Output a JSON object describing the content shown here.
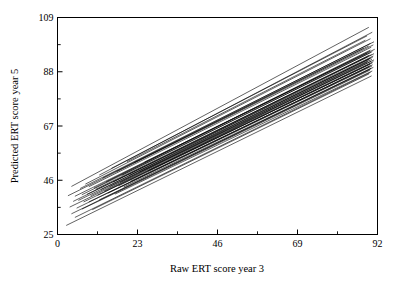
{
  "chart_data": {
    "type": "line",
    "title": "",
    "subtitle": "",
    "xlabel": "Raw ERT score year 3",
    "ylabel": "Predicted ERT score year 5",
    "xlim": [
      0,
      92
    ],
    "ylim": [
      25,
      109
    ],
    "xticks": [
      0,
      23,
      46,
      69,
      92
    ],
    "xticklabels": [
      "0",
      "23",
      "46",
      "69",
      "92"
    ],
    "xminorticks": [
      11.5,
      34.5,
      57.5,
      80.5
    ],
    "yticks": [
      25,
      46,
      67,
      88,
      109
    ],
    "yticklabels": [
      "25",
      "46",
      "67",
      "88",
      "109"
    ],
    "yminorticks": [
      35.5,
      56.5,
      77.5,
      98.5
    ],
    "grid": false,
    "legend": false,
    "legend_position": "none",
    "frame": "box",
    "tick_direction": "in",
    "line_color": "#000000",
    "background_color": "#ffffff",
    "n_series": 46,
    "series": [
      {
        "name": "school-01",
        "x": [
          4.0,
          89.5
        ],
        "y": [
          43.6,
          105.2
        ]
      },
      {
        "name": "school-02",
        "x": [
          12.0,
          90.5
        ],
        "y": [
          48.0,
          103.3
        ]
      },
      {
        "name": "school-03",
        "x": [
          15.5,
          89.0
        ],
        "y": [
          50.6,
          101.9
        ]
      },
      {
        "name": "school-04",
        "x": [
          8.0,
          90.0
        ],
        "y": [
          44.5,
          100.8
        ]
      },
      {
        "name": "school-05",
        "x": [
          20.0,
          88.5
        ],
        "y": [
          53.2,
          100.2
        ]
      },
      {
        "name": "school-06",
        "x": [
          6.5,
          91.0
        ],
        "y": [
          42.8,
          99.6
        ]
      },
      {
        "name": "school-07",
        "x": [
          13.0,
          90.0
        ],
        "y": [
          46.9,
          99.0
        ]
      },
      {
        "name": "school-08",
        "x": [
          3.0,
          90.8
        ],
        "y": [
          40.0,
          98.4
        ]
      },
      {
        "name": "school-09",
        "x": [
          17.0,
          89.5
        ],
        "y": [
          49.4,
          98.0
        ]
      },
      {
        "name": "school-10",
        "x": [
          9.0,
          90.2
        ],
        "y": [
          43.5,
          97.5
        ]
      },
      {
        "name": "school-11",
        "x": [
          22.0,
          88.0
        ],
        "y": [
          52.8,
          97.1
        ]
      },
      {
        "name": "school-12",
        "x": [
          5.0,
          91.2
        ],
        "y": [
          39.8,
          96.7
        ]
      },
      {
        "name": "school-13",
        "x": [
          14.0,
          90.0
        ],
        "y": [
          45.4,
          96.4
        ]
      },
      {
        "name": "school-14",
        "x": [
          10.5,
          89.8
        ],
        "y": [
          43.0,
          96.0
        ]
      },
      {
        "name": "school-15",
        "x": [
          18.5,
          90.5
        ],
        "y": [
          47.9,
          95.8
        ]
      },
      {
        "name": "school-16",
        "x": [
          7.0,
          90.0
        ],
        "y": [
          40.4,
          95.4
        ]
      },
      {
        "name": "school-17",
        "x": [
          25.0,
          89.0
        ],
        "y": [
          53.0,
          95.2
        ]
      },
      {
        "name": "school-18",
        "x": [
          11.0,
          91.0
        ],
        "y": [
          42.5,
          95.0
        ]
      },
      {
        "name": "school-19",
        "x": [
          4.5,
          90.3
        ],
        "y": [
          37.8,
          94.6
        ]
      },
      {
        "name": "school-20",
        "x": [
          16.0,
          89.6
        ],
        "y": [
          45.3,
          94.4
        ]
      },
      {
        "name": "school-21",
        "x": [
          8.5,
          90.8
        ],
        "y": [
          40.6,
          94.1
        ]
      },
      {
        "name": "school-22",
        "x": [
          20.5,
          89.2
        ],
        "y": [
          47.8,
          93.8
        ]
      },
      {
        "name": "school-23",
        "x": [
          12.5,
          90.6
        ],
        "y": [
          42.4,
          93.6
        ]
      },
      {
        "name": "school-24",
        "x": [
          6.0,
          90.0
        ],
        "y": [
          38.2,
          93.3
        ]
      },
      {
        "name": "school-25",
        "x": [
          23.5,
          89.8
        ],
        "y": [
          49.2,
          93.1
        ]
      },
      {
        "name": "school-26",
        "x": [
          15.0,
          90.4
        ],
        "y": [
          43.6,
          92.8
        ]
      },
      {
        "name": "school-27",
        "x": [
          9.5,
          91.0
        ],
        "y": [
          40.0,
          92.6
        ]
      },
      {
        "name": "school-28",
        "x": [
          18.0,
          89.4
        ],
        "y": [
          45.2,
          92.4
        ]
      },
      {
        "name": "school-29",
        "x": [
          3.5,
          90.2
        ],
        "y": [
          35.6,
          92.1
        ]
      },
      {
        "name": "school-30",
        "x": [
          13.5,
          90.8
        ],
        "y": [
          41.8,
          91.9
        ]
      },
      {
        "name": "school-31",
        "x": [
          26.0,
          89.0
        ],
        "y": [
          49.6,
          91.7
        ]
      },
      {
        "name": "school-32",
        "x": [
          7.5,
          90.5
        ],
        "y": [
          37.6,
          91.4
        ]
      },
      {
        "name": "school-33",
        "x": [
          17.5,
          90.0
        ],
        "y": [
          43.8,
          91.2
        ]
      },
      {
        "name": "school-34",
        "x": [
          11.5,
          89.8
        ],
        "y": [
          40.2,
          90.9
        ]
      },
      {
        "name": "school-35",
        "x": [
          21.0,
          90.6
        ],
        "y": [
          45.6,
          90.7
        ]
      },
      {
        "name": "school-36",
        "x": [
          5.5,
          90.0
        ],
        "y": [
          35.2,
          90.4
        ]
      },
      {
        "name": "school-37",
        "x": [
          14.5,
          90.4
        ],
        "y": [
          41.0,
          90.2
        ]
      },
      {
        "name": "school-38",
        "x": [
          9.0,
          89.6
        ],
        "y": [
          37.6,
          89.9
        ]
      },
      {
        "name": "school-39",
        "x": [
          19.0,
          90.8
        ],
        "y": [
          43.4,
          89.7
        ]
      },
      {
        "name": "school-40",
        "x": [
          4.0,
          90.2
        ],
        "y": [
          33.0,
          89.4
        ]
      },
      {
        "name": "school-41",
        "x": [
          12.0,
          90.0
        ],
        "y": [
          38.4,
          89.0
        ]
      },
      {
        "name": "school-42",
        "x": [
          7.0,
          89.8
        ],
        "y": [
          34.8,
          88.6
        ]
      },
      {
        "name": "school-43",
        "x": [
          16.5,
          90.5
        ],
        "y": [
          40.6,
          88.3
        ]
      },
      {
        "name": "school-44",
        "x": [
          5.0,
          90.0
        ],
        "y": [
          31.6,
          87.8
        ]
      },
      {
        "name": "school-45",
        "x": [
          10.0,
          89.6
        ],
        "y": [
          34.6,
          87.2
        ]
      },
      {
        "name": "school-46",
        "x": [
          2.5,
          90.3
        ],
        "y": [
          28.5,
          86.4
        ]
      }
    ]
  },
  "axes": {
    "xlabel": "Raw ERT score year 3",
    "ylabel": "Predicted ERT score year 5"
  }
}
